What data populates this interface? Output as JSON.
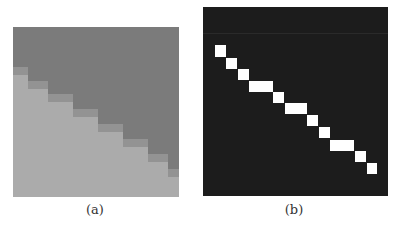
{
  "figure": {
    "panels": [
      {
        "id": "a",
        "caption": "(a)",
        "description": "grayscale image patch with a diagonal staircase edge",
        "colors": {
          "dark_region": "#7b7b7b",
          "mid_band": "#939393",
          "light_region": "#ababab"
        },
        "grid_size": [
          166,
          170
        ],
        "boundary_steps": [
          {
            "x0": 0,
            "x1": 15,
            "y": 48
          },
          {
            "x0": 15,
            "x1": 35,
            "y": 62
          },
          {
            "x0": 35,
            "x1": 60,
            "y": 75
          },
          {
            "x0": 60,
            "x1": 85,
            "y": 90
          },
          {
            "x0": 85,
            "x1": 110,
            "y": 105
          },
          {
            "x0": 110,
            "x1": 135,
            "y": 120
          },
          {
            "x0": 135,
            "x1": 155,
            "y": 135
          },
          {
            "x0": 155,
            "x1": 166,
            "y": 150
          }
        ]
      },
      {
        "id": "b",
        "caption": "(b)",
        "description": "binary edge map: white pixel blocks along a diagonal on black background",
        "colors": {
          "background": "#1c1c1c",
          "edge_pixels": "#ffffff",
          "stripe": "#2a2a2a"
        },
        "grid_size": [
          185,
          189
        ],
        "edge_blocks": [
          {
            "x": 12,
            "y": 38,
            "w": 11,
            "h": 12
          },
          {
            "x": 23,
            "y": 51,
            "w": 11,
            "h": 11
          },
          {
            "x": 35,
            "y": 62,
            "w": 11,
            "h": 11
          },
          {
            "x": 46,
            "y": 74,
            "w": 24,
            "h": 11
          },
          {
            "x": 70,
            "y": 85,
            "w": 11,
            "h": 11
          },
          {
            "x": 82,
            "y": 96,
            "w": 22,
            "h": 11
          },
          {
            "x": 104,
            "y": 108,
            "w": 11,
            "h": 11
          },
          {
            "x": 116,
            "y": 120,
            "w": 11,
            "h": 11
          },
          {
            "x": 127,
            "y": 133,
            "w": 24,
            "h": 11
          },
          {
            "x": 152,
            "y": 144,
            "w": 11,
            "h": 11
          },
          {
            "x": 164,
            "y": 156,
            "w": 10,
            "h": 11
          }
        ]
      }
    ]
  }
}
